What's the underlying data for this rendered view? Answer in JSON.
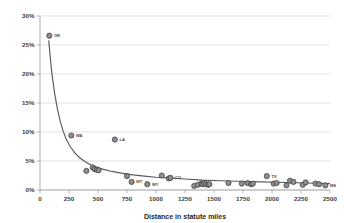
{
  "chart_data": {
    "type": "scatter",
    "title": "",
    "xlabel": "Distance in statute miles",
    "ylabel": "",
    "xlim": [
      0,
      2500
    ],
    "ylim": [
      0,
      0.3
    ],
    "grid": true,
    "legend": null,
    "xticks": [
      0,
      250,
      500,
      750,
      1000,
      1250,
      1500,
      1750,
      2000,
      2250,
      2500
    ],
    "xtick_labels": [
      "0",
      "250",
      "500",
      "750",
      "1000",
      "1250",
      "1500",
      "1750",
      "2000",
      "2250",
      "2500"
    ],
    "yticks": [
      0,
      0.05,
      0.1,
      0.15,
      0.2,
      0.25,
      0.3
    ],
    "ytick_labels": [
      "0%",
      "5%",
      "10%",
      "15%",
      "20%",
      "25%",
      "30%"
    ],
    "series": [
      {
        "name": "states",
        "points": [
          {
            "x": 80,
            "y": 0.266,
            "label": "OR"
          },
          {
            "x": 270,
            "y": 0.094,
            "label": "WA"
          },
          {
            "x": 400,
            "y": 0.033,
            "label": ""
          },
          {
            "x": 455,
            "y": 0.039,
            "label": ""
          },
          {
            "x": 470,
            "y": 0.036,
            "label": ""
          },
          {
            "x": 490,
            "y": 0.035,
            "label": ""
          },
          {
            "x": 505,
            "y": 0.034,
            "label": ""
          },
          {
            "x": 645,
            "y": 0.087,
            "label": "LA"
          },
          {
            "x": 750,
            "y": 0.024,
            "label": ""
          },
          {
            "x": 790,
            "y": 0.014,
            "label": "MT"
          },
          {
            "x": 925,
            "y": 0.01,
            "label": "WY"
          },
          {
            "x": 1050,
            "y": 0.025,
            "label": ""
          },
          {
            "x": 1110,
            "y": 0.02,
            "label": ""
          },
          {
            "x": 1125,
            "y": 0.021,
            "label": "CO"
          },
          {
            "x": 1330,
            "y": 0.007,
            "label": ""
          },
          {
            "x": 1360,
            "y": 0.009,
            "label": ""
          },
          {
            "x": 1390,
            "y": 0.011,
            "label": ""
          },
          {
            "x": 1400,
            "y": 0.01,
            "label": ""
          },
          {
            "x": 1415,
            "y": 0.012,
            "label": ""
          },
          {
            "x": 1430,
            "y": 0.01,
            "label": ""
          },
          {
            "x": 1450,
            "y": 0.009,
            "label": ""
          },
          {
            "x": 1460,
            "y": 0.01,
            "label": ""
          },
          {
            "x": 1625,
            "y": 0.012,
            "label": ""
          },
          {
            "x": 1740,
            "y": 0.011,
            "label": ""
          },
          {
            "x": 1790,
            "y": 0.012,
            "label": ""
          },
          {
            "x": 1820,
            "y": 0.01,
            "label": ""
          },
          {
            "x": 1835,
            "y": 0.011,
            "label": ""
          },
          {
            "x": 1955,
            "y": 0.024,
            "label": "TX"
          },
          {
            "x": 2015,
            "y": 0.011,
            "label": ""
          },
          {
            "x": 2040,
            "y": 0.012,
            "label": ""
          },
          {
            "x": 2125,
            "y": 0.008,
            "label": ""
          },
          {
            "x": 2155,
            "y": 0.016,
            "label": ""
          },
          {
            "x": 2185,
            "y": 0.014,
            "label": ""
          },
          {
            "x": 2265,
            "y": 0.009,
            "label": ""
          },
          {
            "x": 2290,
            "y": 0.013,
            "label": ""
          },
          {
            "x": 2375,
            "y": 0.011,
            "label": ""
          },
          {
            "x": 2405,
            "y": 0.01,
            "label": ""
          },
          {
            "x": 2460,
            "y": 0.008,
            "label": "MS"
          }
        ]
      }
    ],
    "fit_curve": {
      "description": "decaying power-law trend line",
      "points": [
        {
          "x": 75,
          "y": 0.258
        },
        {
          "x": 100,
          "y": 0.205
        },
        {
          "x": 125,
          "y": 0.168
        },
        {
          "x": 150,
          "y": 0.14
        },
        {
          "x": 175,
          "y": 0.118
        },
        {
          "x": 200,
          "y": 0.101
        },
        {
          "x": 230,
          "y": 0.086
        },
        {
          "x": 260,
          "y": 0.075
        },
        {
          "x": 300,
          "y": 0.064
        },
        {
          "x": 340,
          "y": 0.056
        },
        {
          "x": 380,
          "y": 0.05
        },
        {
          "x": 430,
          "y": 0.044
        },
        {
          "x": 480,
          "y": 0.04
        },
        {
          "x": 540,
          "y": 0.036
        },
        {
          "x": 620,
          "y": 0.032
        },
        {
          "x": 700,
          "y": 0.029
        },
        {
          "x": 800,
          "y": 0.026
        },
        {
          "x": 900,
          "y": 0.024
        },
        {
          "x": 1000,
          "y": 0.022
        },
        {
          "x": 1100,
          "y": 0.021
        },
        {
          "x": 1250,
          "y": 0.019
        },
        {
          "x": 1400,
          "y": 0.017
        },
        {
          "x": 1550,
          "y": 0.016
        },
        {
          "x": 1700,
          "y": 0.015
        },
        {
          "x": 1900,
          "y": 0.014
        },
        {
          "x": 2100,
          "y": 0.013
        },
        {
          "x": 2300,
          "y": 0.012
        },
        {
          "x": 2500,
          "y": 0.011
        }
      ]
    }
  },
  "colors": {
    "marker_fill": "#8e8e8e",
    "marker_stroke": "#3d3d3d",
    "curve": "#5a5a5a",
    "grid": "#d0d0d0",
    "axis": "#9a9a9a",
    "text": "#3a3a3a",
    "background": "#ffffff"
  }
}
